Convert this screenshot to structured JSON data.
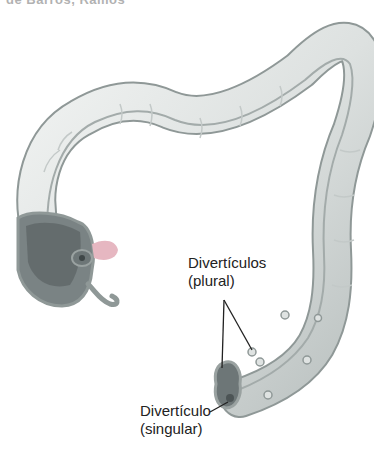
{
  "header": {
    "cropped_text": "de Barros, Ramos"
  },
  "figure": {
    "labels": {
      "plural_line1": "Divertículos",
      "plural_line2": "(plural)",
      "singular_line1": "Divertículo",
      "singular_line2": "(singular)"
    },
    "colors": {
      "colon_fill": "#dfe3e2",
      "colon_shade": "#aeb5b4",
      "colon_outline": "#8f9897",
      "lumen_dark": "#5f6768",
      "appendix_pink": "#e6b7c1",
      "leader_line": "#222222"
    }
  }
}
